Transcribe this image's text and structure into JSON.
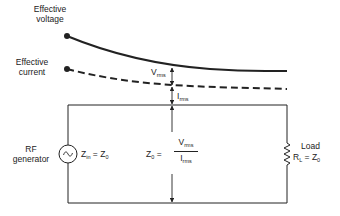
{
  "labels": {
    "effective_voltage": [
      "Effective",
      "voltage"
    ],
    "effective_current": [
      "Effective",
      "current"
    ],
    "v_rms": {
      "main": "V",
      "sub": "rms"
    },
    "i_rms": {
      "main": "I",
      "sub": "rms"
    },
    "generator": [
      "RF",
      "generator"
    ],
    "z_in": {
      "main": "Z",
      "sub": "in",
      "rest": " = Z",
      "sub2": "0"
    },
    "z0_formula": {
      "lhs": "Z",
      "lhs_sub": "0",
      "eq": " =",
      "num": "V",
      "num_sub": "rms",
      "den": "I",
      "den_sub": "rms"
    },
    "load": {
      "title": "Load",
      "main": "R",
      "sub": "L",
      "rest": " = Z",
      "sub2": "0"
    }
  },
  "colors": {
    "line": "#222222",
    "background": "#ffffff"
  },
  "curves": {
    "voltage": {
      "style": "solid",
      "start": [
        67,
        36
      ],
      "end": [
        287,
        71
      ]
    },
    "current": {
      "style": "dashed",
      "start": [
        67,
        69
      ],
      "end": [
        287,
        89
      ]
    }
  }
}
